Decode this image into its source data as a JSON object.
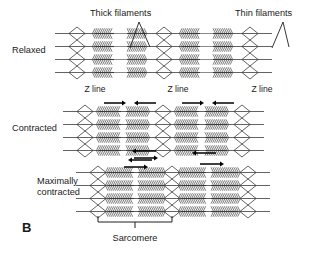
{
  "figure": {
    "panel_letter": "B",
    "background_color": "#ffffff",
    "ink_color": "#1a1a1a",
    "width": 330,
    "height": 253,
    "caption_label": "Sarcomere"
  },
  "annotations": [
    {
      "id": "thick",
      "text": "Thick filaments",
      "x": 90,
      "y": 16,
      "anchor": "start"
    },
    {
      "id": "thin",
      "text": "Thin filaments",
      "x": 235,
      "y": 16,
      "anchor": "start"
    }
  ],
  "row_labels": [
    {
      "id": "relaxed",
      "lines": [
        "Relaxed"
      ],
      "x": 12,
      "y": 53
    },
    {
      "id": "contracted",
      "lines": [
        "Contracted"
      ],
      "x": 12,
      "y": 131
    },
    {
      "id": "max-contracted",
      "lines": [
        "Maximally",
        "contracted"
      ],
      "x": 37,
      "y": 184
    }
  ],
  "z_line_labels": [
    {
      "text": "Z line",
      "x": 95,
      "y": 92
    },
    {
      "text": "Z line",
      "x": 178,
      "y": 92
    },
    {
      "text": "Z line",
      "x": 262,
      "y": 92
    }
  ],
  "rows": [
    {
      "id": "relaxed",
      "state": "Relaxed",
      "center_y": 53,
      "myofibril_count": 4,
      "fiber_spacing": 13,
      "sarcomeres": [
        {
          "z_left": 77,
          "z_right": 164,
          "band_left_start": 95,
          "band_left_end": 114,
          "band_right_start": 127,
          "band_right_end": 146,
          "h_zone": true
        },
        {
          "z_left": 164,
          "z_right": 250,
          "band_left_start": 182,
          "band_left_end": 200,
          "band_right_start": 213,
          "band_right_end": 232,
          "h_zone": true
        }
      ],
      "arrows": []
    },
    {
      "id": "contracted",
      "state": "Contracted",
      "center_y": 131,
      "myofibril_count": 4,
      "fiber_spacing": 13,
      "sarcomeres": [
        {
          "z_left": 85,
          "z_right": 163,
          "band_left_start": 99,
          "band_left_end": 121,
          "band_right_start": 126,
          "band_right_end": 148,
          "h_zone": false
        },
        {
          "z_left": 163,
          "z_right": 242,
          "band_left_start": 177,
          "band_left_end": 199,
          "band_right_start": 205,
          "band_right_end": 227,
          "h_zone": false
        }
      ],
      "arrows": [
        {
          "x_start": 104,
          "x_end": 126,
          "y": 103,
          "direction": "right"
        },
        {
          "x_start": 156,
          "x_end": 134,
          "y": 103,
          "direction": "left"
        },
        {
          "x_start": 182,
          "x_end": 204,
          "y": 103,
          "direction": "right"
        },
        {
          "x_start": 234,
          "x_end": 212,
          "y": 103,
          "direction": "left"
        }
      ]
    },
    {
      "id": "max-contracted",
      "state": "Maximally contracted",
      "center_y": 192,
      "myofibril_count": 4,
      "fiber_spacing": 13,
      "sarcomeres": [
        {
          "z_left": 98,
          "z_right": 172,
          "band_left_start": 108,
          "band_left_end": 134,
          "band_right_start": 138,
          "band_right_end": 164,
          "h_zone": false
        },
        {
          "z_left": 172,
          "z_right": 248,
          "band_left_start": 181,
          "band_left_end": 206,
          "band_right_start": 211,
          "band_right_end": 238,
          "h_zone": false
        }
      ],
      "arrows": [
        {
          "x_start": 134,
          "x_end": 158,
          "y": 158,
          "direction": "right"
        },
        {
          "x_start": 156,
          "x_end": 132,
          "y": 151,
          "direction": "left"
        },
        {
          "x_start": 124,
          "x_end": 148,
          "y": 167,
          "direction": "right"
        },
        {
          "x_start": 152,
          "x_end": 128,
          "y": 160,
          "direction": "left"
        },
        {
          "x_start": 216,
          "x_end": 192,
          "y": 153,
          "direction": "left"
        },
        {
          "x_start": 200,
          "x_end": 224,
          "y": 164,
          "direction": "right"
        }
      ]
    }
  ],
  "sarcomere_bracket": {
    "x_left": 98,
    "x_right": 172,
    "y": 222,
    "tick_y": 228,
    "label_y": 241
  },
  "leaders": {
    "thick": {
      "apex_x": 139,
      "apex_y": 22,
      "targets": [
        [
          130,
          48
        ],
        [
          150,
          47
        ]
      ]
    },
    "thin": {
      "apex_x": 283,
      "apex_y": 22,
      "targets": [
        [
          272,
          48
        ],
        [
          289,
          47
        ]
      ]
    }
  }
}
